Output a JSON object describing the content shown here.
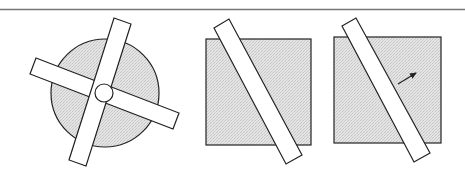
{
  "diagram": {
    "colors": {
      "background": "#ffffff",
      "stroke": "#222222",
      "shaded_fill": "#dcdcdc",
      "strip_fill": "#ffffff",
      "rule": "#777777"
    },
    "top_rule": {
      "y": 9.5,
      "x1": 0,
      "x2": 465
    },
    "panels": [
      {
        "id": "panel-1",
        "shape": "circle",
        "circle": {
          "cx": 105,
          "cy": 93,
          "r": 54
        },
        "strips": [
          {
            "id": "strip-horizontal",
            "points": "36,58 179,113 173,129 30,74"
          },
          {
            "id": "strip-vertical",
            "points": "114,18 131,24 86,166 69,160"
          }
        ],
        "center_circle": {
          "cx": 104,
          "cy": 93,
          "r": 9
        }
      },
      {
        "id": "panel-2",
        "shape": "square",
        "square": {
          "x": 206,
          "y": 39,
          "w": 105,
          "h": 106
        },
        "strips": [
          {
            "id": "strip-diagonal",
            "points": "214,28 229,19 302,155 286,164"
          }
        ]
      },
      {
        "id": "panel-3",
        "shape": "square",
        "square": {
          "x": 334,
          "y": 37,
          "w": 107,
          "h": 106
        },
        "strips": [
          {
            "id": "strip-diagonal",
            "points": "342,26 356,18 430,153 414,162"
          }
        ],
        "arrow": {
          "x1": 398,
          "y1": 84,
          "x2": 416,
          "y2": 73,
          "label": "direction-arrow"
        }
      }
    ]
  }
}
